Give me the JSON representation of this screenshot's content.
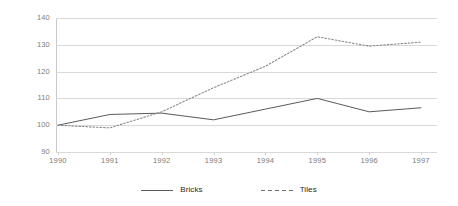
{
  "chart_data": {
    "type": "line",
    "title": "",
    "xlabel": "",
    "ylabel": "",
    "x": [
      "1990",
      "1991",
      "1992",
      "1993",
      "1994",
      "1995",
      "1996",
      "1997"
    ],
    "categories": [
      "1990",
      "1991",
      "1992",
      "1993",
      "1994",
      "1995",
      "1996",
      "1997"
    ],
    "ylim": [
      90,
      140
    ],
    "yticks": [
      "90",
      "100",
      "110",
      "120",
      "130",
      "140"
    ],
    "ytick_values": [
      90,
      100,
      110,
      120,
      130,
      140
    ],
    "grid": true,
    "legend_position": "bottom-center",
    "series": [
      {
        "name": "Bricks",
        "style": "solid",
        "color": "#5a5a5a",
        "values": [
          100,
          104,
          104.5,
          102,
          106,
          110,
          105,
          106.5
        ]
      },
      {
        "name": "Tiles",
        "style": "dotted",
        "color": "#8a8a8a",
        "values": [
          100,
          99,
          105,
          114,
          122,
          133,
          129.5,
          131
        ]
      }
    ]
  },
  "legend": {
    "items": [
      {
        "label": "Bricks",
        "swatch": "solid-line-swatch"
      },
      {
        "label": "Tiles",
        "swatch": "dashed-line-swatch"
      }
    ]
  },
  "colors": {
    "background": "#ffffff",
    "gridline": "#d9d9d9",
    "axis": "#c8c8c8",
    "tick_text": "#7b7b7b",
    "legend_text": "#262626",
    "series_bricks": "#5a5a5a",
    "series_tiles": "#8a8a8a"
  }
}
